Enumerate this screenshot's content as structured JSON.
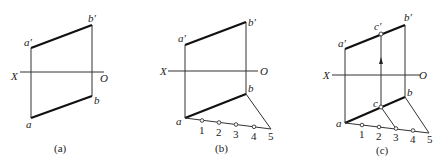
{
  "figures": [
    {
      "id": "a",
      "caption": "(a)",
      "axis": {
        "left_label": "X",
        "right_label": "O"
      },
      "points": {
        "a_prime": "a′",
        "b_prime": "b′",
        "a": "a",
        "b": "b"
      }
    },
    {
      "id": "b",
      "caption": "(b)",
      "axis": {
        "left_label": "X",
        "right_label": "O"
      },
      "points": {
        "a_prime": "a′",
        "b_prime": "b′",
        "a": "a",
        "b": "b"
      },
      "divisions": [
        "1",
        "2",
        "3",
        "4",
        "5"
      ]
    },
    {
      "id": "c",
      "caption": "(c)",
      "axis": {
        "left_label": "X",
        "right_label": "O"
      },
      "points": {
        "a_prime": "a′",
        "b_prime": "b′",
        "c_prime": "c′",
        "a": "a",
        "b": "b",
        "c": "c"
      },
      "divisions": [
        "1",
        "2",
        "3",
        "4",
        "5"
      ]
    }
  ],
  "colors": {
    "line": "#222222",
    "background": "#ffffff"
  }
}
